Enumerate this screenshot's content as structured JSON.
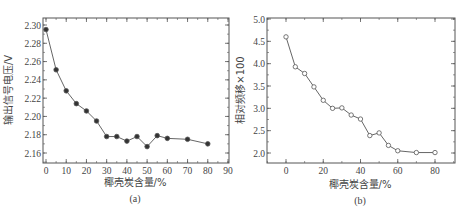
{
  "chart_data": [
    {
      "id": "a",
      "type": "line",
      "caption": "(a)",
      "title": "",
      "xlabel": "椰壳炭含量/%",
      "ylabel": "输出信号电压/V",
      "xlim": [
        -2,
        90
      ],
      "ylim": [
        2.15,
        2.3
      ],
      "xticks": [
        0,
        10,
        20,
        30,
        40,
        50,
        60,
        70,
        80,
        90
      ],
      "yticks": [
        2.16,
        2.18,
        2.2,
        2.22,
        2.24,
        2.26,
        2.28,
        2.3
      ],
      "ytick_labels": [
        "2.16",
        "2.18",
        "2.20",
        "2.22",
        "2.24",
        "2.26",
        "2.28",
        "2.30"
      ],
      "marker": "filled-circle",
      "grid": false,
      "x": [
        0,
        5,
        10,
        15,
        20,
        25,
        30,
        35,
        40,
        45,
        50,
        55,
        60,
        70,
        80
      ],
      "values": [
        2.295,
        2.251,
        2.228,
        2.214,
        2.206,
        2.195,
        2.178,
        2.178,
        2.173,
        2.178,
        2.167,
        2.179,
        2.176,
        2.175,
        2.17
      ]
    },
    {
      "id": "b",
      "type": "line",
      "caption": "(b)",
      "title": "",
      "xlabel": "椰壳炭含量/%",
      "ylabel": "相对频移×100",
      "xlim": [
        -10,
        90
      ],
      "ylim": [
        1.75,
        5.0
      ],
      "xticks": [
        0,
        20,
        40,
        60,
        80
      ],
      "yticks": [
        2.0,
        2.5,
        3.0,
        3.5,
        4.0,
        4.5,
        5.0
      ],
      "ytick_labels": [
        "2.0",
        "2.5",
        "3.0",
        "3.5",
        "4.0",
        "4.5",
        "5.0"
      ],
      "marker": "open-circle",
      "grid": false,
      "x": [
        0,
        5,
        10,
        15,
        20,
        25,
        30,
        35,
        40,
        45,
        50,
        55,
        60,
        70,
        80
      ],
      "values": [
        4.6,
        3.93,
        3.78,
        3.48,
        3.18,
        3.0,
        3.01,
        2.85,
        2.76,
        2.39,
        2.45,
        2.17,
        2.05,
        2.01,
        2.01
      ]
    }
  ],
  "colors": {
    "axis": "#555555",
    "line": "#555555",
    "marker_fill_a": "#333333",
    "marker_fill_b": "#ffffff",
    "text": "#444444"
  }
}
